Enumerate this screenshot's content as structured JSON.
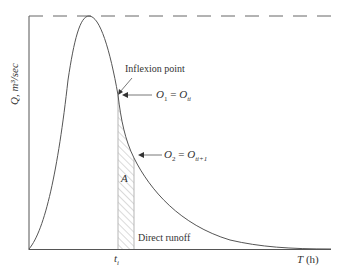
{
  "diagram": {
    "type": "hydrograph",
    "y_axis_label": "Q, m³/sec",
    "x_axis_label_var": "T",
    "x_axis_label_unit": "(h)",
    "tick_label": "t",
    "tick_sub": "i",
    "annotations": {
      "inflexion": "Inflexion point",
      "o1_left": "O",
      "o1_left_sub": "1",
      "o1_eq": " = ",
      "o1_right": "O",
      "o1_right_sub": "ti",
      "o2_left": "O",
      "o2_left_sub": "2",
      "o2_eq": " = ",
      "o2_right": "O",
      "o2_right_sub": "ti+1",
      "area": "A",
      "direct_runoff": "Direct runoff"
    },
    "colors": {
      "line": "#555555",
      "hatch": "#b0b0b0",
      "text": "#333333"
    }
  }
}
